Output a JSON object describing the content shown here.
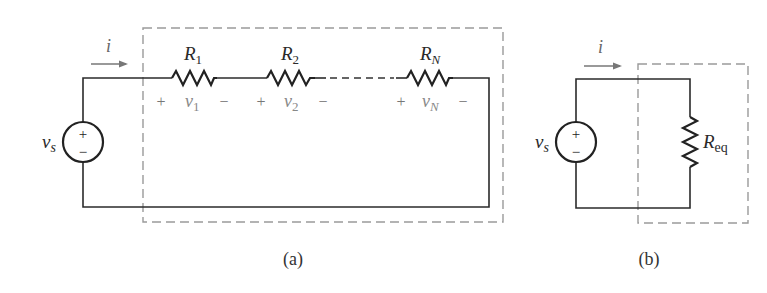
{
  "figure": {
    "panel_a": {
      "caption": "(a)",
      "source": {
        "label": "v",
        "subscript": "s",
        "plus": "+",
        "minus": "−"
      },
      "current": {
        "label": "i"
      },
      "resistors": [
        {
          "label": "R",
          "subscript": "1",
          "voltage": "v",
          "voltage_sub": "1",
          "plus": "+",
          "minus": "−"
        },
        {
          "label": "R",
          "subscript": "2",
          "voltage": "v",
          "voltage_sub": "2",
          "plus": "+",
          "minus": "−"
        },
        {
          "label": "R",
          "subscript": "N",
          "voltage": "v",
          "voltage_sub": "N",
          "plus": "+",
          "minus": "−"
        }
      ]
    },
    "panel_b": {
      "caption": "(b)",
      "source": {
        "label": "v",
        "subscript": "s",
        "plus": "+",
        "minus": "−"
      },
      "current": {
        "label": "i"
      },
      "resistor": {
        "label": "R",
        "subscript": "eq"
      }
    },
    "colors": {
      "wire": "#2b2b2b",
      "dashed_box": "#9a9a9a",
      "polarity_text": "#777777"
    }
  }
}
